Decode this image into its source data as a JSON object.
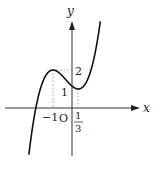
{
  "diagram": {
    "type": "function-graph",
    "function": "cubic with local max at (-1, 2) and local min at (1/3, 1)",
    "axes": {
      "x_label": "x",
      "y_label": "y",
      "origin_label": "O"
    },
    "tick_labels": {
      "x_neg": "−1",
      "x_frac_num": "1",
      "x_frac_den": "3",
      "y_max": "2",
      "y_min": "1"
    },
    "critical_points": [
      {
        "x": -1,
        "y": 2,
        "kind": "local maximum"
      },
      {
        "x": 0.3333,
        "y": 1,
        "kind": "local minimum"
      }
    ],
    "colors": {
      "curve": "#111111",
      "axes": "#333333",
      "guides": "#888888"
    }
  }
}
